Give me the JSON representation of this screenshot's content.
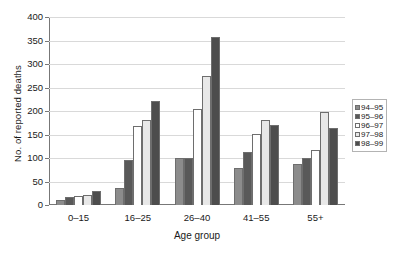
{
  "chart_data": {
    "type": "bar",
    "title": "",
    "xlabel": "Age group",
    "ylabel": "No. of reported deaths",
    "categories": [
      "0–15",
      "16–25",
      "26–40",
      "41–55",
      "55+"
    ],
    "series": [
      {
        "name": "94–95",
        "color": "#8c8c8c",
        "values": [
          10,
          37,
          100,
          78,
          88
        ]
      },
      {
        "name": "95–96",
        "color": "#595959",
        "values": [
          16,
          95,
          100,
          112,
          100
        ]
      },
      {
        "name": "96–97",
        "color": "#ffffff",
        "values": [
          20,
          169,
          204,
          152,
          118
        ]
      },
      {
        "name": "97–98",
        "color": "#e8e8e8",
        "values": [
          22,
          181,
          275,
          180,
          197
        ]
      },
      {
        "name": "98–99",
        "color": "#4d4d4d",
        "values": [
          30,
          222,
          357,
          170,
          163
        ]
      }
    ],
    "ylim": [
      0,
      400
    ],
    "yticks": [
      0,
      50,
      100,
      150,
      200,
      250,
      300,
      350,
      400
    ],
    "ytick_labels": [
      "0",
      "50",
      "100",
      "150",
      "200",
      "250",
      "300",
      "350",
      "400"
    ],
    "grid": true,
    "legend_position": "right",
    "axis_color": "#777777",
    "gridline_color": "#d9d9d9",
    "bar_border_color": "#6e6e6e"
  }
}
